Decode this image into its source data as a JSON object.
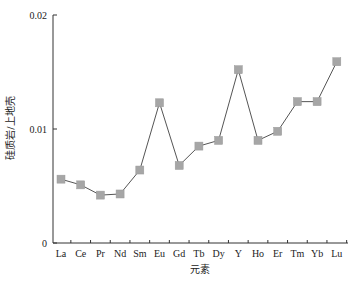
{
  "chart_data": {
    "type": "line",
    "title": "",
    "xlabel": "元素",
    "ylabel": "硅质岩/上地壳",
    "categories": [
      "La",
      "Ce",
      "Pr",
      "Nd",
      "Sm",
      "Eu",
      "Gd",
      "Tb",
      "Dy",
      "Y",
      "Ho",
      "Er",
      "Tm",
      "Yb",
      "Lu"
    ],
    "series": [
      {
        "name": "硅质岩/上地壳",
        "values": [
          0.0056,
          0.0051,
          0.0042,
          0.0043,
          0.0064,
          0.0123,
          0.0068,
          0.0085,
          0.009,
          0.0152,
          0.009,
          0.0098,
          0.0124,
          0.0124,
          0.0159
        ],
        "marker": "square",
        "marker_color": "#a6a6a6",
        "line_color": "#555555"
      }
    ],
    "ylim": [
      0,
      0.02
    ],
    "yticks": [
      0,
      0.01,
      0.02
    ],
    "ytick_labels": [
      "0",
      "0.01",
      "0.02"
    ],
    "grid": false,
    "legend": null
  }
}
